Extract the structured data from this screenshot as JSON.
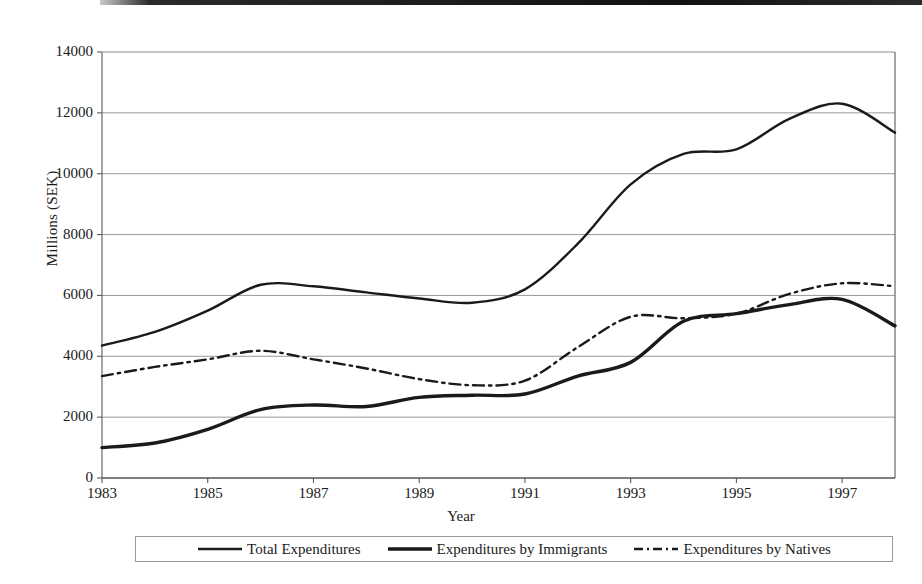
{
  "figure": {
    "background": "#ffffff",
    "line_color": "#1a1a1a",
    "grid_color": "#8d8d8d",
    "axis_color": "#5a5a5a"
  },
  "axis": {
    "y_title": "Millions (SEK)",
    "x_title": "Year",
    "y_ticks": [
      "0",
      "2000",
      "4000",
      "6000",
      "8000",
      "10000",
      "12000",
      "14000"
    ],
    "x_ticks": [
      "1983",
      "1985",
      "1987",
      "1989",
      "1991",
      "1993",
      "1995",
      "1997"
    ]
  },
  "legend": {
    "entries": [
      {
        "label": "Total Expenditures",
        "style": "solid-thin",
        "swatch": "legend-line-total"
      },
      {
        "label": "Expenditures by Immigrants",
        "style": "solid-thick",
        "swatch": "legend-line-immigrants"
      },
      {
        "label": "Expenditures by Natives",
        "style": "dash-dot",
        "swatch": "legend-line-natives"
      }
    ]
  },
  "chart_data": {
    "type": "line",
    "title": "",
    "xlabel": "Year",
    "ylabel": "Millions (SEK)",
    "xlim": [
      1983,
      1998
    ],
    "ylim": [
      0,
      14000
    ],
    "ytick_step": 2000,
    "xtick_step": 2,
    "grid": true,
    "legend_position": "bottom",
    "x": [
      1983,
      1984,
      1985,
      1986,
      1987,
      1988,
      1989,
      1990,
      1991,
      1992,
      1993,
      1994,
      1995,
      1996,
      1997,
      1998
    ],
    "series": [
      {
        "name": "Total Expenditures",
        "style": "solid-thin",
        "values": [
          4350,
          4800,
          5500,
          6350,
          6300,
          6100,
          5900,
          5760,
          6200,
          7700,
          9650,
          10650,
          10800,
          11800,
          12300,
          11350
        ]
      },
      {
        "name": "Expenditures by Immigrants",
        "style": "solid-thick",
        "values": [
          1000,
          1150,
          1600,
          2250,
          2400,
          2350,
          2650,
          2720,
          2760,
          3350,
          3800,
          5150,
          5400,
          5700,
          5870,
          5000
        ]
      },
      {
        "name": "Expenditures by Natives",
        "style": "dash-dot",
        "values": [
          3350,
          3650,
          3900,
          4180,
          3900,
          3600,
          3250,
          3050,
          3200,
          4300,
          5300,
          5250,
          5400,
          6050,
          6400,
          6300
        ]
      }
    ]
  }
}
